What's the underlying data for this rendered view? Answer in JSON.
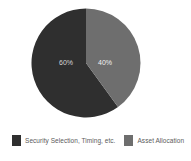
{
  "chart_data": {
    "type": "pie",
    "title": "",
    "subtitle": "",
    "xlabel": "",
    "ylabel": "",
    "grid": false,
    "legend_position": "bottom",
    "start_angle_deg": 0,
    "direction": "counterclockwise-first-slice",
    "categories": [
      "Security Selection, Timing, etc.",
      "Asset Allocation"
    ],
    "values": [
      60,
      40
    ],
    "value_labels": [
      "60%",
      "40%"
    ],
    "colors": [
      "#2f2f2f",
      "#6e6e6e"
    ],
    "slices": [
      {
        "name": "Security Selection, Timing, etc.",
        "value": 60,
        "label": "60%",
        "color": "#2f2f2f",
        "label_x": 66,
        "label_y": 63
      },
      {
        "name": "Asset Allocation",
        "value": 40,
        "label": "40%",
        "color": "#6e6e6e",
        "label_x": 105,
        "label_y": 63
      }
    ]
  },
  "legend": {
    "items": [
      {
        "label": "Security Selection, Timing, etc.",
        "color": "#2f2f2f",
        "swatch_name": "legend-swatch-security-selection"
      },
      {
        "label": "Asset Allocation",
        "color": "#6e6e6e",
        "swatch_name": "legend-swatch-asset-allocation"
      }
    ]
  },
  "theme": {
    "background": "#ffffff",
    "text_color": "#5a5a5a",
    "slice_dark": "#2f2f2f",
    "slice_light": "#6e6e6e",
    "label_on_dark": "#d8d8d8",
    "label_on_light": "#f2f2f2"
  }
}
